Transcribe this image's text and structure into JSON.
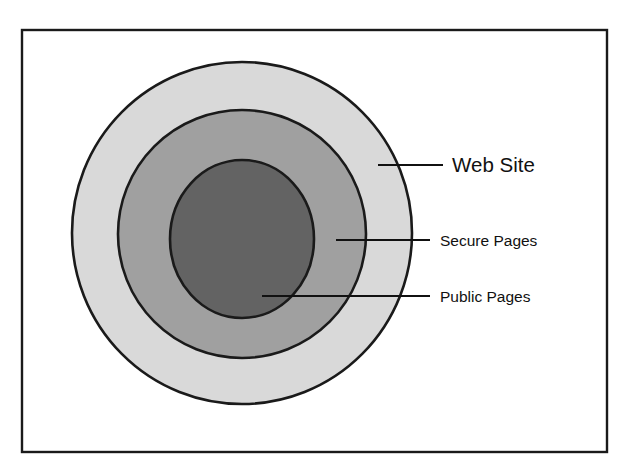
{
  "diagram": {
    "type": "concentric-circles",
    "frame": {
      "name": "diagram-border",
      "x": 22,
      "y": 30,
      "width": 585,
      "height": 422,
      "stroke": "#1a1a1a",
      "fill": "#ffffff"
    },
    "rings": [
      {
        "id": "web-site",
        "label": "Web Site",
        "level": 1,
        "cx": 242,
        "cy": 233,
        "rx": 170,
        "ry": 171,
        "fill": "#d9d9d9",
        "stroke": "#1a1a1a"
      },
      {
        "id": "secure-pages",
        "label": "Secure Pages",
        "level": 2,
        "cx": 242,
        "cy": 234,
        "rx": 124,
        "ry": 124,
        "fill": "#a0a0a0",
        "stroke": "#1a1a1a"
      },
      {
        "id": "public-pages",
        "label": "Public Pages",
        "level": 3,
        "cx": 242,
        "cy": 239,
        "rx": 72,
        "ry": 79,
        "fill": "#636363",
        "stroke": "#1a1a1a"
      }
    ],
    "callouts": [
      {
        "id": "callout-web-site",
        "label": "Web Site",
        "line": {
          "x1": 378,
          "y1": 165,
          "x2": 443,
          "y2": 165
        },
        "text": {
          "x": 452,
          "y": 172
        }
      },
      {
        "id": "callout-secure-pages",
        "label": "Secure Pages",
        "line": {
          "x1": 336,
          "y1": 240,
          "x2": 430,
          "y2": 240
        },
        "text": {
          "x": 440,
          "y": 246
        }
      },
      {
        "id": "callout-public-pages",
        "label": "Public Pages",
        "line": {
          "x1": 262,
          "y1": 296,
          "x2": 430,
          "y2": 296
        },
        "text": {
          "x": 440,
          "y": 302
        }
      }
    ]
  }
}
